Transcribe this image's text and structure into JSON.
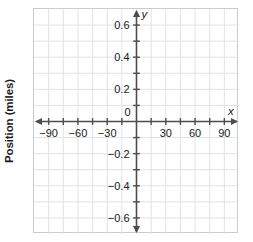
{
  "chart_data": {
    "type": "line",
    "title": "",
    "xlabel": "x",
    "ylabel": "Position (miles)",
    "y_axis_name": "y",
    "x_axis_name": "x",
    "series": [],
    "values": [],
    "x": [],
    "categories": [],
    "xlim": [
      -105,
      105
    ],
    "ylim": [
      -0.7,
      0.7
    ],
    "x_tick_step": 15,
    "x_label_step": 30,
    "y_tick_step": 0.1,
    "y_label_step": 0.2,
    "grid": true,
    "legend": "none",
    "origin_label": "0",
    "x_tick_labels": [
      "-90",
      "-60",
      "-30",
      "30",
      "60",
      "90"
    ],
    "x_tick_values": [
      -90,
      -60,
      -30,
      30,
      60,
      90
    ],
    "y_tick_labels": [
      "0.6",
      "0.4",
      "0.2",
      "-0.2",
      "-0.4",
      "-0.6"
    ],
    "y_tick_values": [
      0.6,
      0.4,
      0.2,
      -0.2,
      -0.4,
      -0.6
    ],
    "colors": {
      "grid": "#dfe3e6",
      "axis": "#4d4d4d",
      "frame": "#c8ccd0",
      "text": "#1a1a1a",
      "background": "#ffffff"
    }
  },
  "axis": {
    "y_title": "Position (miles)",
    "x_name": "x",
    "y_name": "y",
    "origin": "0"
  },
  "x_labels": [
    {
      "text": "-90",
      "value": -90
    },
    {
      "text": "-60",
      "value": -60
    },
    {
      "text": "-30",
      "value": -30
    },
    {
      "text": "30",
      "value": 30
    },
    {
      "text": "60",
      "value": 60
    },
    {
      "text": "90",
      "value": 90
    }
  ],
  "y_labels": [
    {
      "text": "0.6",
      "value": 0.6
    },
    {
      "text": "0.4",
      "value": 0.4
    },
    {
      "text": "0.2",
      "value": 0.2
    },
    {
      "text": "-0.2",
      "value": -0.2
    },
    {
      "text": "-0.4",
      "value": -0.4
    },
    {
      "text": "-0.6",
      "value": -0.6
    }
  ]
}
